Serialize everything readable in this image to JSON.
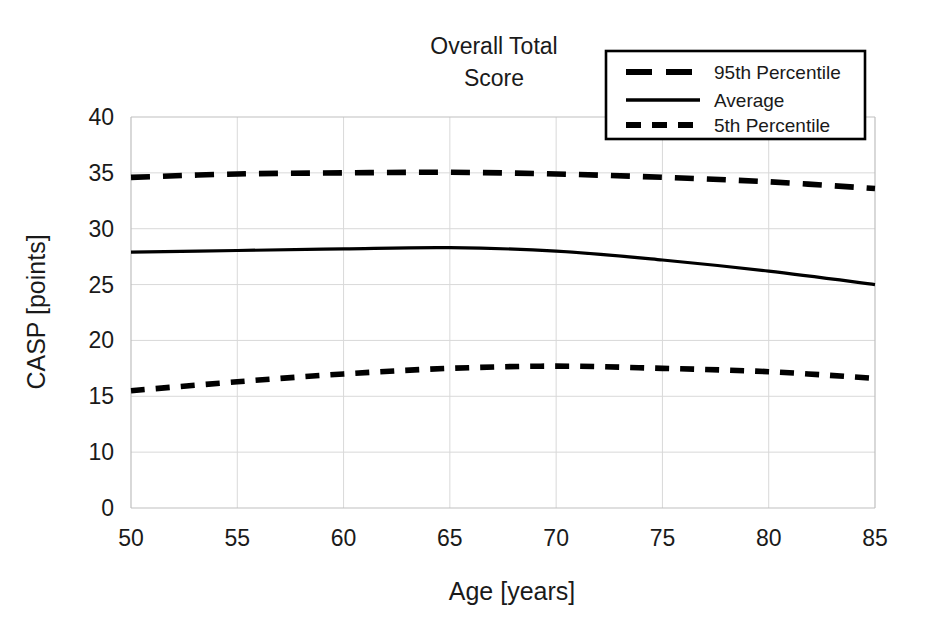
{
  "chart_data": {
    "type": "line",
    "title": "Overall Total Score",
    "title_lines": [
      "Overall Total",
      "Score"
    ],
    "xlabel": "Age [years]",
    "ylabel": "CASP [points]",
    "xlim": [
      50,
      85
    ],
    "ylim": [
      0,
      40
    ],
    "xticks": [
      50,
      55,
      60,
      65,
      70,
      75,
      80,
      85
    ],
    "yticks": [
      0,
      10,
      15,
      20,
      25,
      30,
      35,
      40
    ],
    "ytick_labels": [
      "0",
      "10",
      "15",
      "20",
      "25",
      "30",
      "35",
      "40"
    ],
    "gridlines_y": [
      10,
      15,
      20,
      25,
      30,
      35
    ],
    "grid": true,
    "legend_position": "top-right",
    "x": [
      50,
      55,
      60,
      65,
      70,
      75,
      80,
      85
    ],
    "series": [
      {
        "name": "95th Percentile",
        "style": "long-dash",
        "color": "#000000",
        "values": [
          34.6,
          34.9,
          35.0,
          35.05,
          34.9,
          34.6,
          34.2,
          33.6
        ]
      },
      {
        "name": "Average",
        "style": "solid",
        "color": "#000000",
        "values": [
          27.9,
          28.05,
          28.2,
          28.3,
          28.0,
          27.2,
          26.2,
          25.0
        ]
      },
      {
        "name": "5th Percentile",
        "style": "short-dash",
        "color": "#000000",
        "values": [
          15.5,
          16.3,
          17.0,
          17.5,
          17.7,
          17.5,
          17.2,
          16.6
        ]
      }
    ]
  },
  "legend": {
    "entries": [
      {
        "label": "95th Percentile",
        "style": "long-dash"
      },
      {
        "label": "Average",
        "style": "solid"
      },
      {
        "label": "5th Percentile",
        "style": "short-dash"
      }
    ]
  },
  "colors": {
    "line": "#000000",
    "grid": "#d9d9d9",
    "background": "#ffffff"
  }
}
